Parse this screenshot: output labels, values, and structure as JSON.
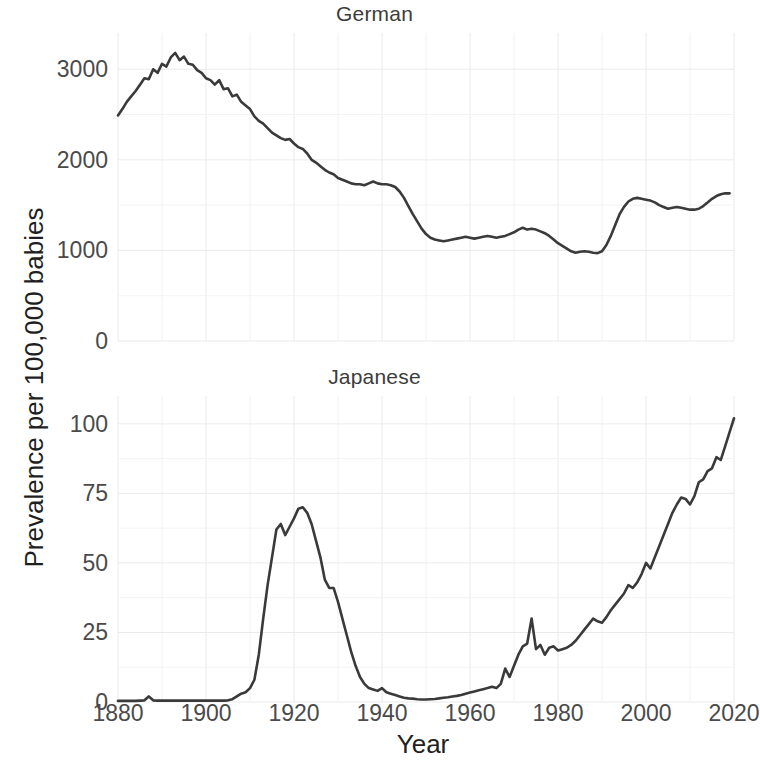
{
  "figure": {
    "xlabel": "Year",
    "ylabel": "Prevalence per 100,000 babies",
    "panels": [
      {
        "id": "german",
        "title": "German"
      },
      {
        "id": "japanese",
        "title": "Japanese"
      }
    ]
  },
  "chart_data": [
    {
      "type": "line",
      "title": "German",
      "xlabel": "Year",
      "ylabel": "Prevalence per 100,000 babies",
      "xlim": [
        1880,
        2020
      ],
      "ylim": [
        0,
        3400
      ],
      "xticks": [
        1880,
        1900,
        1920,
        1940,
        1960,
        1980,
        2000,
        2020
      ],
      "yticks": [
        0,
        1000,
        2000,
        3000
      ],
      "ytick_labels": [
        "0",
        "1000",
        "2000",
        "3000"
      ],
      "grid": true,
      "legend": "none",
      "series": [
        {
          "name": "German",
          "x": [
            1880,
            1881,
            1882,
            1883,
            1884,
            1885,
            1886,
            1887,
            1888,
            1889,
            1890,
            1891,
            1892,
            1893,
            1894,
            1895,
            1896,
            1897,
            1898,
            1899,
            1900,
            1901,
            1902,
            1903,
            1904,
            1905,
            1906,
            1907,
            1908,
            1909,
            1910,
            1911,
            1912,
            1913,
            1914,
            1915,
            1916,
            1917,
            1918,
            1919,
            1920,
            1921,
            1922,
            1923,
            1924,
            1925,
            1926,
            1927,
            1928,
            1929,
            1930,
            1931,
            1932,
            1933,
            1934,
            1935,
            1936,
            1937,
            1938,
            1939,
            1940,
            1941,
            1942,
            1943,
            1944,
            1945,
            1946,
            1947,
            1948,
            1949,
            1950,
            1951,
            1952,
            1953,
            1954,
            1955,
            1956,
            1957,
            1958,
            1959,
            1960,
            1961,
            1962,
            1963,
            1964,
            1965,
            1966,
            1967,
            1968,
            1969,
            1970,
            1971,
            1972,
            1973,
            1974,
            1975,
            1976,
            1977,
            1978,
            1979,
            1980,
            1981,
            1982,
            1983,
            1984,
            1985,
            1986,
            1987,
            1988,
            1989,
            1990,
            1991,
            1992,
            1993,
            1994,
            1995,
            1996,
            1997,
            1998,
            1999,
            2000,
            2001,
            2002,
            2003,
            2004,
            2005,
            2006,
            2007,
            2008,
            2009,
            2010,
            2011,
            2012,
            2013,
            2014,
            2015,
            2016,
            2017,
            2018,
            2019,
            2020
          ],
          "y": [
            2490,
            2560,
            2640,
            2700,
            2760,
            2830,
            2900,
            2890,
            3000,
            2960,
            3060,
            3030,
            3130,
            3180,
            3100,
            3140,
            3060,
            3050,
            2990,
            2960,
            2900,
            2880,
            2830,
            2880,
            2780,
            2790,
            2700,
            2720,
            2640,
            2600,
            2560,
            2480,
            2430,
            2400,
            2350,
            2300,
            2270,
            2240,
            2220,
            2230,
            2180,
            2140,
            2120,
            2070,
            2000,
            1970,
            1930,
            1890,
            1860,
            1840,
            1800,
            1780,
            1760,
            1740,
            1730,
            1730,
            1720,
            1740,
            1760,
            1740,
            1730,
            1730,
            1720,
            1700,
            1650,
            1580,
            1490,
            1400,
            1320,
            1240,
            1180,
            1140,
            1120,
            1110,
            1100,
            1110,
            1120,
            1130,
            1140,
            1150,
            1140,
            1130,
            1140,
            1150,
            1160,
            1150,
            1140,
            1150,
            1160,
            1180,
            1200,
            1230,
            1250,
            1230,
            1240,
            1230,
            1210,
            1190,
            1160,
            1120,
            1080,
            1050,
            1020,
            990,
            975,
            985,
            990,
            985,
            975,
            970,
            990,
            1060,
            1160,
            1280,
            1400,
            1480,
            1540,
            1570,
            1580,
            1570,
            1560,
            1550,
            1530,
            1500,
            1480,
            1460,
            1470,
            1480,
            1470,
            1460,
            1450,
            1450,
            1460,
            1490,
            1530,
            1570,
            1600,
            1620,
            1630,
            1630
          ]
        }
      ]
    },
    {
      "type": "line",
      "title": "Japanese",
      "xlabel": "Year",
      "ylabel": "Prevalence per 100,000 babies",
      "xlim": [
        1880,
        2020
      ],
      "ylim": [
        0,
        110
      ],
      "xticks": [
        1880,
        1900,
        1920,
        1940,
        1960,
        1980,
        2000,
        2020
      ],
      "yticks": [
        0,
        25,
        50,
        75,
        100
      ],
      "ytick_labels": [
        "0",
        "25",
        "50",
        "75",
        "100"
      ],
      "grid": true,
      "legend": "none",
      "series": [
        {
          "name": "Japanese",
          "x": [
            1880,
            1881,
            1882,
            1883,
            1884,
            1885,
            1886,
            1887,
            1888,
            1889,
            1890,
            1891,
            1892,
            1893,
            1894,
            1895,
            1896,
            1897,
            1898,
            1899,
            1900,
            1901,
            1902,
            1903,
            1904,
            1905,
            1906,
            1907,
            1908,
            1909,
            1910,
            1911,
            1912,
            1913,
            1914,
            1915,
            1916,
            1917,
            1918,
            1919,
            1920,
            1921,
            1922,
            1923,
            1924,
            1925,
            1926,
            1927,
            1928,
            1929,
            1930,
            1931,
            1932,
            1933,
            1934,
            1935,
            1936,
            1937,
            1938,
            1939,
            1940,
            1941,
            1942,
            1943,
            1944,
            1945,
            1946,
            1947,
            1948,
            1949,
            1950,
            1951,
            1952,
            1953,
            1954,
            1955,
            1956,
            1957,
            1958,
            1959,
            1960,
            1961,
            1962,
            1963,
            1964,
            1965,
            1966,
            1967,
            1968,
            1969,
            1970,
            1971,
            1972,
            1973,
            1974,
            1975,
            1976,
            1977,
            1978,
            1979,
            1980,
            1981,
            1982,
            1983,
            1984,
            1985,
            1986,
            1987,
            1988,
            1989,
            1990,
            1991,
            1992,
            1993,
            1994,
            1995,
            1996,
            1997,
            1998,
            1999,
            2000,
            2001,
            2002,
            2003,
            2004,
            2005,
            2006,
            2007,
            2008,
            2009,
            2010,
            2011,
            2012,
            2013,
            2014,
            2015,
            2016,
            2017,
            2018,
            2019,
            2020
          ],
          "y": [
            0.4,
            0.4,
            0.4,
            0.4,
            0.4,
            0.5,
            0.6,
            2.0,
            0.6,
            0.5,
            0.5,
            0.5,
            0.5,
            0.5,
            0.5,
            0.5,
            0.5,
            0.5,
            0.5,
            0.5,
            0.5,
            0.5,
            0.5,
            0.5,
            0.5,
            0.6,
            1.0,
            2.0,
            3.0,
            3.5,
            5.0,
            8.0,
            17.0,
            30.0,
            42.0,
            52.0,
            62.0,
            64.0,
            60.0,
            63.0,
            66.0,
            69.5,
            70.0,
            68.0,
            64.0,
            58.0,
            52.0,
            44.0,
            41.0,
            41.0,
            36.0,
            30.0,
            24.0,
            18.0,
            13.0,
            9.0,
            6.5,
            5.0,
            4.5,
            4.0,
            5.0,
            3.5,
            3.0,
            2.5,
            2.0,
            1.5,
            1.3,
            1.2,
            1.0,
            0.9,
            0.9,
            1.0,
            1.1,
            1.3,
            1.5,
            1.7,
            2.0,
            2.2,
            2.5,
            3.0,
            3.4,
            3.8,
            4.2,
            4.6,
            5.0,
            5.5,
            5.0,
            6.5,
            12.0,
            9.0,
            13.0,
            17.0,
            20.0,
            21.0,
            30.0,
            19.0,
            20.5,
            17.0,
            19.5,
            20.0,
            18.5,
            19.0,
            19.5,
            20.5,
            22.0,
            24.0,
            26.0,
            28.0,
            30.0,
            29.0,
            28.5,
            30.5,
            33.0,
            35.0,
            37.0,
            39.0,
            42.0,
            41.0,
            43.0,
            46.0,
            50.0,
            48.0,
            52.0,
            56.0,
            60.0,
            64.0,
            68.0,
            71.0,
            73.5,
            73.0,
            71.0,
            74.0,
            79.0,
            80.0,
            83.0,
            84.0,
            88.0,
            87.0,
            92.0,
            97.0,
            102.0
          ]
        }
      ]
    }
  ]
}
